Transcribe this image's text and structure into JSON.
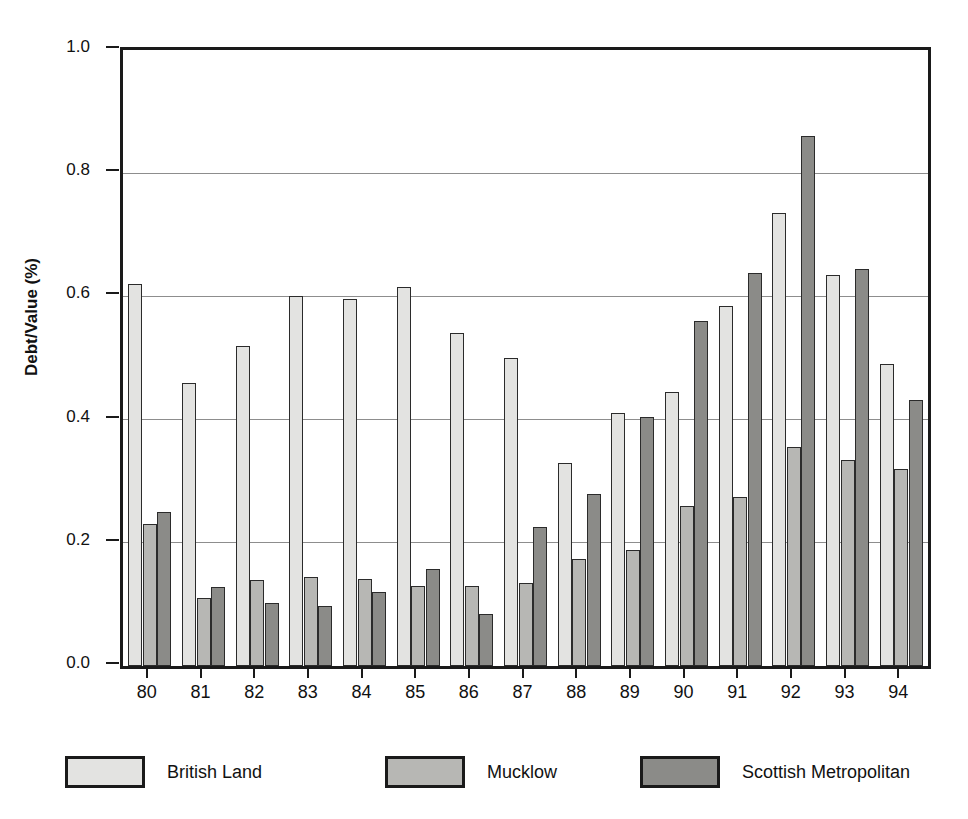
{
  "chart_data": {
    "type": "bar",
    "title": "",
    "xlabel": "",
    "ylabel": "Debt/Value (%)",
    "ylim": [
      0.0,
      1.0
    ],
    "yticks": [
      "0.0",
      "0.2",
      "0.4",
      "0.6",
      "0.8",
      "1.0"
    ],
    "ytick_values": [
      0.0,
      0.2,
      0.4,
      0.6,
      0.8,
      1.0
    ],
    "grid": true,
    "legend_position": "bottom",
    "categories": [
      "80",
      "81",
      "82",
      "83",
      "84",
      "85",
      "86",
      "87",
      "88",
      "89",
      "90",
      "91",
      "92",
      "93",
      "94"
    ],
    "series": [
      {
        "name": "British Land",
        "color": "#e3e3e1",
        "values": [
          0.62,
          0.46,
          0.52,
          0.6,
          0.595,
          0.615,
          0.54,
          0.5,
          0.33,
          0.41,
          0.445,
          0.585,
          0.735,
          0.635,
          0.49
        ]
      },
      {
        "name": "Mucklow",
        "color": "#b7b7b4",
        "values": [
          0.23,
          0.11,
          0.14,
          0.145,
          0.142,
          0.13,
          0.13,
          0.135,
          0.173,
          0.188,
          0.26,
          0.275,
          0.355,
          0.335,
          0.32
        ]
      },
      {
        "name": "Scottish Metropolitan",
        "color": "#8b8b88",
        "values": [
          0.25,
          0.128,
          0.103,
          0.098,
          0.12,
          0.158,
          0.085,
          0.225,
          0.28,
          0.405,
          0.56,
          0.638,
          0.86,
          0.645,
          0.432
        ]
      }
    ]
  },
  "axes": {
    "y_title": "Debt/Value (%)"
  },
  "legend": {
    "items": [
      {
        "label": "British Land",
        "swatch": "legend-swatch-british-land"
      },
      {
        "label": "Mucklow",
        "swatch": "legend-swatch-mucklow"
      },
      {
        "label": "Scottish Metropolitan",
        "swatch": "legend-swatch-scottish-metropolitan"
      }
    ]
  }
}
